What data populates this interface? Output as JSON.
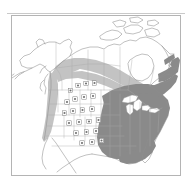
{
  "page": {
    "background_color": "#ffffff",
    "width": 191,
    "height": 188,
    "header_mark": "",
    "caption": ""
  },
  "map": {
    "title": "North America distribution map",
    "frame_color": "#b4b4b4",
    "outline_color": "#8e8e8e",
    "state_line_color": "#a8a8a8",
    "background_color": "#ffffff",
    "projection_note": "Lambert conformal conic, North America",
    "legend": {
      "core_range_label": "Core range",
      "core_range_color": "#8a8a8a",
      "peripheral_range_label": "Peripheral range",
      "peripheral_range_color": "#c3c3c3",
      "record_point_label": "Isolated record",
      "record_point_color": "#6f6f6f"
    },
    "regions": {
      "core_range_description": "Eastern and central United States, Atlantic Canada, Gaspe Peninsula and Newfoundland",
      "peripheral_range_description": "Band across British Columbia, Alberta, Saskatchewan, Manitoba and northern Ontario, plus the Pacific Northwest coastal strip"
    },
    "record_points": [
      {
        "id": "pt-01",
        "x": 58.5,
        "y": 74.5
      },
      {
        "id": "pt-02",
        "x": 66.0,
        "y": 69.5
      },
      {
        "id": "pt-03",
        "x": 74.0,
        "y": 67.5
      },
      {
        "id": "pt-04",
        "x": 82.5,
        "y": 67.0
      },
      {
        "id": "pt-05",
        "x": 55.0,
        "y": 86.0
      },
      {
        "id": "pt-06",
        "x": 63.0,
        "y": 83.0
      },
      {
        "id": "pt-07",
        "x": 72.0,
        "y": 81.0
      },
      {
        "id": "pt-08",
        "x": 81.0,
        "y": 80.0
      },
      {
        "id": "pt-09",
        "x": 52.5,
        "y": 97.0
      },
      {
        "id": "pt-10",
        "x": 61.0,
        "y": 95.0
      },
      {
        "id": "pt-11",
        "x": 70.5,
        "y": 94.0
      },
      {
        "id": "pt-12",
        "x": 80.0,
        "y": 93.0
      },
      {
        "id": "pt-13",
        "x": 57.0,
        "y": 107.0
      },
      {
        "id": "pt-14",
        "x": 67.0,
        "y": 106.0
      },
      {
        "id": "pt-15",
        "x": 77.0,
        "y": 105.5
      },
      {
        "id": "pt-16",
        "x": 86.5,
        "y": 104.0
      },
      {
        "id": "pt-17",
        "x": 64.0,
        "y": 117.0
      },
      {
        "id": "pt-18",
        "x": 74.5,
        "y": 116.0
      },
      {
        "id": "pt-19",
        "x": 84.0,
        "y": 115.0
      },
      {
        "id": "pt-20",
        "x": 70.0,
        "y": 127.0
      },
      {
        "id": "pt-21",
        "x": 80.0,
        "y": 126.0
      },
      {
        "id": "pt-22",
        "x": 89.5,
        "y": 124.5
      }
    ]
  }
}
